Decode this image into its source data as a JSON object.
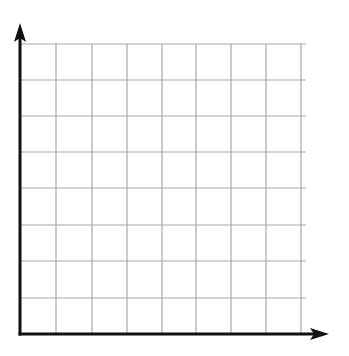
{
  "diagram": {
    "type": "blank-coordinate-grid",
    "columns": 8,
    "rows": 8,
    "grid_color": "#a8a8a8",
    "axis_color": "#111111",
    "background": "#ffffff",
    "origin": {
      "x": 20,
      "y": 334
    },
    "x_axis": {
      "end_x": 329,
      "label": ""
    },
    "y_axis": {
      "end_y": 23,
      "label": ""
    },
    "vertical_lines_x": [
      56,
      92,
      127,
      162,
      196,
      231,
      266,
      301
    ],
    "horizontal_lines_y": [
      44,
      80,
      116,
      152,
      188,
      225,
      261,
      298
    ],
    "grid_right": 306,
    "grid_top": 44
  }
}
